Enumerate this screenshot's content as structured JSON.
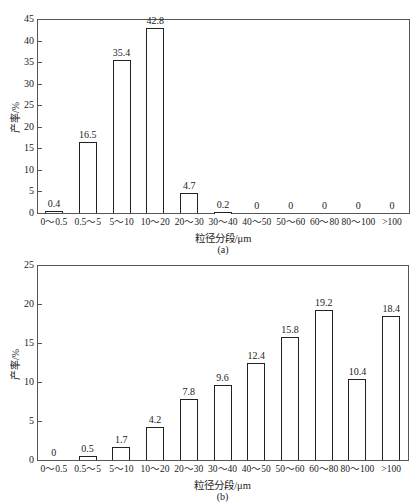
{
  "chart_data": [
    {
      "type": "bar",
      "panel": "(a)",
      "title": "",
      "xlabel": "粒径分段/μm",
      "ylabel": "产率/%",
      "ylim": [
        0,
        45
      ],
      "yticks": [
        0,
        5,
        10,
        15,
        20,
        25,
        30,
        35,
        40,
        45
      ],
      "grid": false,
      "categories": [
        "0～0.5",
        "0.5～5",
        "5～10",
        "10～20",
        "20～30",
        "30～40",
        "40～50",
        "50～60",
        "60～80",
        "80～100",
        ">100"
      ],
      "values": [
        0.4,
        16.5,
        35.4,
        42.8,
        4.7,
        0.2,
        0,
        0,
        0,
        0,
        0
      ],
      "value_labels": [
        "0.4",
        "16.5",
        "35.4",
        "42.8",
        "4.7",
        "0.2",
        "0",
        "0",
        "0",
        "0",
        "0"
      ]
    },
    {
      "type": "bar",
      "panel": "(b)",
      "title": "",
      "xlabel": "粒径分段/μm",
      "ylabel": "产率/%",
      "ylim": [
        0,
        25
      ],
      "yticks": [
        0,
        5,
        10,
        15,
        20,
        25
      ],
      "grid": false,
      "categories": [
        "0～0.5",
        "0.5～5",
        "5～10",
        "10～20",
        "20～30",
        "30～40",
        "40～50",
        "50～60",
        "60～80",
        "80～100",
        ">100"
      ],
      "values": [
        0,
        0.5,
        1.7,
        4.2,
        7.8,
        9.6,
        12.4,
        15.8,
        19.2,
        10.4,
        18.4
      ],
      "value_labels": [
        "0",
        "0.5",
        "1.7",
        "4.2",
        "7.8",
        "9.6",
        "12.4",
        "15.8",
        "19.2",
        "10.4",
        "18.4"
      ]
    }
  ],
  "colors": {
    "bar_fill": "#ffffff",
    "bar_stroke": "#222222",
    "axis": "#555555"
  }
}
